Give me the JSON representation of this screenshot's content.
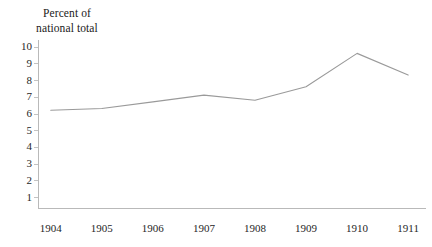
{
  "chart_data": {
    "type": "line",
    "title": "Percent of\nnational total",
    "xlabel": "",
    "ylabel": "Percent of national total",
    "categories": [
      "1904",
      "1905",
      "1906",
      "1907",
      "1908",
      "1909",
      "1910",
      "1911"
    ],
    "x": [
      1904,
      1905,
      1906,
      1907,
      1908,
      1909,
      1910,
      1911
    ],
    "values": [
      6.2,
      6.3,
      6.7,
      7.1,
      6.8,
      7.6,
      9.6,
      8.3
    ],
    "series": [
      {
        "name": "Percent of national total",
        "values": [
          6.2,
          6.3,
          6.7,
          7.1,
          6.8,
          7.6,
          9.6,
          8.3
        ]
      }
    ],
    "ylim": [
      0.35,
      10.4
    ],
    "xlim": [
      1903.75,
      1911.35
    ],
    "yticks": [
      1,
      2,
      3,
      4,
      5,
      6,
      7,
      8,
      9,
      10
    ],
    "ytick_labels": [
      "1",
      "2",
      "3",
      "4",
      "5",
      "6",
      "7",
      "8",
      "9",
      "10"
    ],
    "xticks": [
      1904,
      1905,
      1906,
      1907,
      1908,
      1909,
      1910,
      1911
    ],
    "xtick_labels": [
      "1904",
      "1905",
      "1906",
      "1907",
      "1908",
      "1909",
      "1910",
      "1911"
    ],
    "grid": false,
    "legend": false,
    "legend_position": "none",
    "line_color": "#9a9a9a",
    "axis_color": "#b9b9b9",
    "text_color": "#1a1a1a",
    "background_color": "#ffffff"
  }
}
